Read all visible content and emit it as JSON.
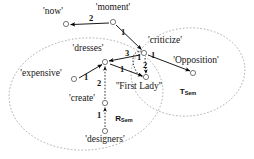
{
  "figure": {
    "type": "semantic-dependency-graph",
    "background": "#ffffff",
    "node_color": "#ffffff",
    "node_stroke": "#555555",
    "edge_color": "#000000",
    "ellipse_color": "#999999"
  },
  "regions": [
    {
      "id": "rsem",
      "label": "R",
      "subscript": "Sem",
      "cx": 86,
      "cy": 94,
      "rx": 77,
      "ry": 56,
      "rot": -4,
      "label_x": 124,
      "label_y": 119
    },
    {
      "id": "tsem",
      "label": "T",
      "subscript": "Sem",
      "cx": 188,
      "cy": 72,
      "rx": 57,
      "ry": 44,
      "rot": -6,
      "label_x": 188,
      "label_y": 92
    }
  ],
  "nodes": [
    {
      "id": "now",
      "label": "'now'",
      "cx": 66,
      "cy": 24,
      "label_x": 53,
      "label_y": 12,
      "anchor": "center"
    },
    {
      "id": "moment",
      "label": "'moment'",
      "cx": 113,
      "cy": 22,
      "label_x": 113,
      "label_y": 8,
      "anchor": "center"
    },
    {
      "id": "criticize",
      "label": "'criticize'",
      "cx": 144,
      "cy": 53,
      "label_x": 165,
      "label_y": 41,
      "anchor": "center"
    },
    {
      "id": "opposition",
      "label": "'Opposition'",
      "cx": 193,
      "cy": 73,
      "label_x": 196,
      "label_y": 61,
      "anchor": "center"
    },
    {
      "id": "dresses",
      "label": "'dresses'",
      "cx": 105,
      "cy": 62,
      "label_x": 88,
      "label_y": 49,
      "anchor": "center"
    },
    {
      "id": "expensive",
      "label": "'expensive'",
      "cx": 74,
      "cy": 79,
      "label_x": 41,
      "label_y": 74,
      "anchor": "center"
    },
    {
      "id": "firstlady",
      "label": "''First Lady''",
      "cx": 146,
      "cy": 77,
      "label_x": 139,
      "label_y": 86,
      "anchor": "center"
    },
    {
      "id": "create",
      "label": "'create'",
      "cx": 105,
      "cy": 103,
      "label_x": 82,
      "label_y": 99,
      "anchor": "center"
    },
    {
      "id": "designers",
      "label": "'designers'",
      "cx": 105,
      "cy": 131,
      "label_x": 105,
      "label_y": 137,
      "anchor": "center"
    }
  ],
  "edges": [
    {
      "id": "moment-now",
      "from": "moment",
      "to": "now",
      "arc": 0,
      "weight": "2",
      "wx": 91,
      "wy": 18,
      "style": "solid"
    },
    {
      "id": "moment-criticize",
      "from": "moment",
      "to": "criticize",
      "arc": 0,
      "weight": "1",
      "wx": 122,
      "wy": 31,
      "style": "solid"
    },
    {
      "id": "criticize-dresses",
      "from": "criticize",
      "to": "dresses",
      "arc": 0,
      "weight": "3",
      "wx": 127,
      "wy": 50,
      "style": "solid"
    },
    {
      "id": "criticize-self-left",
      "from": "criticize",
      "to": "criticize",
      "arc": 1,
      "weight": "1",
      "wx": 139,
      "wy": 57,
      "style": "dashed"
    },
    {
      "id": "criticize-opposition",
      "from": "criticize",
      "to": "opposition",
      "arc": 0,
      "weight": "1",
      "wx": 155,
      "wy": 56,
      "style": "solid"
    },
    {
      "id": "criticize-firstlady",
      "from": "criticize",
      "to": "firstlady",
      "arc": 0,
      "weight": "2",
      "wx": 144,
      "wy": 64,
      "style": "dashed"
    },
    {
      "id": "dresses-firstlady",
      "from": "dresses",
      "to": "firstlady",
      "arc": 0,
      "weight": "1",
      "wx": 122,
      "wy": 68,
      "style": "solid"
    },
    {
      "id": "expensive-dresses",
      "from": "expensive",
      "to": "dresses",
      "arc": 0,
      "weight": "1",
      "wx": 85,
      "wy": 76,
      "style": "solid"
    },
    {
      "id": "create-dresses",
      "from": "create",
      "to": "dresses",
      "arc": 0,
      "weight": "2",
      "wx": 99,
      "wy": 82,
      "style": "dashed"
    },
    {
      "id": "designers-create",
      "from": "designers",
      "to": "create",
      "arc": 0,
      "weight": "1",
      "wx": 99,
      "wy": 114,
      "style": "dashed"
    }
  ]
}
